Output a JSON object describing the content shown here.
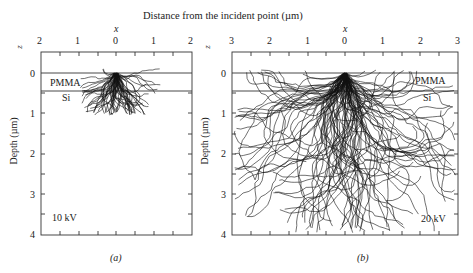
{
  "figure": {
    "top_title": "Distance from the incident point (µm)",
    "ylabel": "Depth (µm)"
  },
  "chart_data": [
    {
      "type": "scatter",
      "panel": "(a)",
      "title": "",
      "xlabel": "x",
      "ylabel": "Depth (µm)",
      "zlabel": "z",
      "x_tick_labels": [
        "2",
        "1",
        "0",
        "1",
        "2"
      ],
      "y_tick_labels": [
        "0",
        "1",
        "2",
        "3",
        "4"
      ],
      "xlim": [
        -2,
        2
      ],
      "ylim": [
        0,
        4
      ],
      "layers": [
        {
          "name": "PMMA",
          "from": 0,
          "to": 0.4
        },
        {
          "name": "Si",
          "from": 0.4,
          "to": 4
        }
      ],
      "annotation": "10 kV",
      "description": "Monte Carlo electron trajectories; compact cloud within ~0.6 µm laterally, max depth ~1.0 µm",
      "grid": false
    },
    {
      "type": "scatter",
      "panel": "(b)",
      "title": "",
      "xlabel": "x",
      "ylabel": "Depth (µm)",
      "zlabel": "z",
      "x_tick_labels": [
        "3",
        "2",
        "1",
        "0",
        "1",
        "2",
        "3"
      ],
      "y_tick_labels": [
        "0",
        "1",
        "2",
        "3",
        "4"
      ],
      "xlim": [
        -3,
        3
      ],
      "ylim": [
        0,
        4
      ],
      "layers": [
        {
          "name": "PMMA",
          "from": 0,
          "to": 0.4
        },
        {
          "name": "Si",
          "from": 0.4,
          "to": 4
        }
      ],
      "annotation": "20 kV",
      "description": "Monte Carlo electron trajectories; broad pear-shaped spread up to ~3 µm laterally and ~4 µm deep",
      "grid": false
    }
  ],
  "panels": {
    "a": {
      "x_axis_label": "x",
      "z_label": "z",
      "pmma": "PMMA",
      "si": "Si",
      "energy": "10 kV",
      "caption": "(a)",
      "xticks": [
        "2",
        "1",
        "0",
        "1",
        "2"
      ],
      "yticks": [
        "0",
        "1",
        "2",
        "3",
        "4"
      ]
    },
    "b": {
      "x_axis_label": "x",
      "z_label": "z",
      "pmma": "PMMA",
      "si": "Si",
      "energy": "20 kV",
      "caption": "(b)",
      "xticks": [
        "3",
        "2",
        "1",
        "0",
        "1",
        "2",
        "3"
      ],
      "yticks": [
        "0",
        "1",
        "2",
        "3",
        "4"
      ]
    }
  }
}
